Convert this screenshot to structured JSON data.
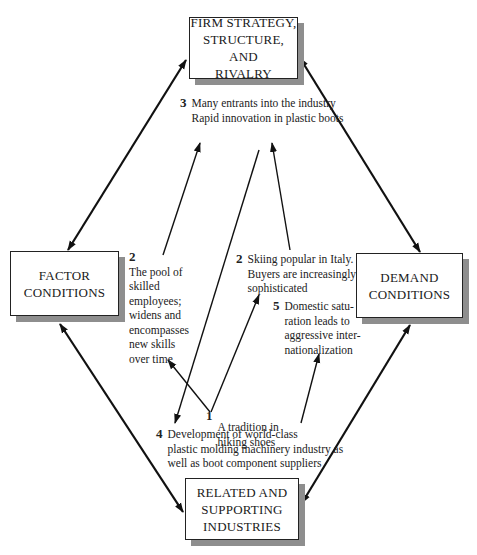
{
  "diagram": {
    "type": "Porter's Diamond",
    "boxes": {
      "top": "FIRM STRATEGY,\nSTRUCTURE, AND\nRIVALRY",
      "left": "FACTOR\nCONDITIONS",
      "right": "DEMAND\nCONDITIONS",
      "bottom": "RELATED AND\nSUPPORTING\nINDUSTRIES"
    },
    "notes": [
      {
        "num": "1",
        "text": "A tradition in\nhiking shoes"
      },
      {
        "num": "2",
        "text": "The pool of\nskilled\nemployees;\nwidens and\nencompasses\nnew skills\nover time"
      },
      {
        "num": "2",
        "text": "Skiing popular in Italy.\nBuyers are increasingly\nsophisticated"
      },
      {
        "num": "3",
        "text": "Many entrants into the industry\nRapid innovation in plastic boots"
      },
      {
        "num": "4",
        "text": "Development of world-class\nplastic molding machinery industry as\nwell as boot component suppliers"
      },
      {
        "num": "5",
        "text": "Domestic satu-\nration leads to\naggressive inter-\nnationalization"
      }
    ],
    "edges": [
      {
        "from": "top",
        "to": "left",
        "bidirectional": true
      },
      {
        "from": "top",
        "to": "right",
        "bidirectional": true
      },
      {
        "from": "left",
        "to": "bottom",
        "bidirectional": true
      },
      {
        "from": "right",
        "to": "bottom",
        "bidirectional": true
      },
      {
        "from": "note-1",
        "to": "note-2-left"
      },
      {
        "from": "note-1",
        "to": "note-2-right"
      },
      {
        "from": "note-2-left",
        "to": "note-3"
      },
      {
        "from": "note-2-right",
        "to": "note-3"
      },
      {
        "from": "note-3",
        "to": "note-4"
      },
      {
        "from": "note-4",
        "to": "note-5"
      }
    ]
  }
}
